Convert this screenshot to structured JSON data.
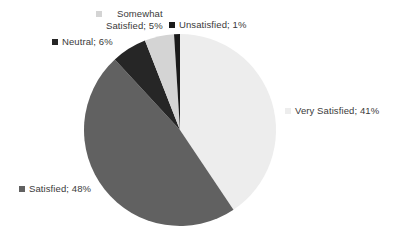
{
  "chart_data": {
    "type": "pie",
    "title": "",
    "subtitle": "",
    "xlabel": "",
    "ylabel": "",
    "grid": false,
    "legend_position": "none",
    "label_format": "name; percent",
    "start_angle_deg": 0,
    "direction": "clockwise",
    "categories": [
      "Very Satisfied",
      "Satisfied",
      "Neutral",
      "Somewhat Satisfied",
      "Unsatisfied"
    ],
    "values": [
      41,
      48,
      6,
      5,
      1
    ],
    "unit": "%",
    "slices": [
      {
        "name": "Very Satisfied",
        "value": 41,
        "percent": "41%",
        "label": "Very Satisfied; 41%",
        "color": "#ededed",
        "swatch_color": "#ededed"
      },
      {
        "name": "Satisfied",
        "value": 48,
        "percent": "48%",
        "label": "Satisfied; 48%",
        "color": "#616161",
        "swatch_color": "#616161"
      },
      {
        "name": "Neutral",
        "value": 6,
        "percent": "6%",
        "label": "Neutral; 6%",
        "color": "#262626",
        "swatch_color": "#262626"
      },
      {
        "name": "Somewhat Satisfied",
        "value": 5,
        "percent": "5%",
        "label": "Somewhat\nSatisfied; 5%",
        "color": "#d4d4d4",
        "swatch_color": "#d4d4d4"
      },
      {
        "name": "Unsatisfied",
        "value": 1,
        "percent": "1%",
        "label": "Unsatisfied; 1%",
        "color": "#1a1a1a",
        "swatch_color": "#1a1a1a"
      }
    ]
  },
  "geometry": {
    "center_x": 180,
    "center_y": 130,
    "radius": 96
  },
  "colors": {
    "background": "#ffffff",
    "text": "#3a3a3a"
  }
}
